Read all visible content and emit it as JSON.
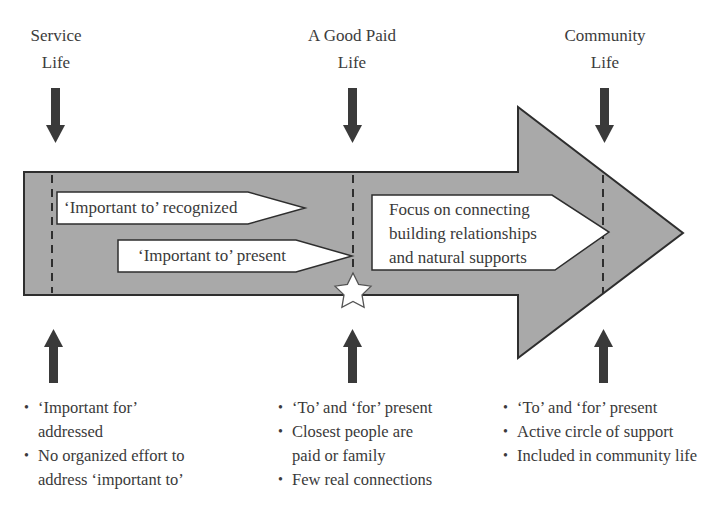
{
  "stages": [
    {
      "title_line1": "Service",
      "title_line2": "Life"
    },
    {
      "title_line1": "A Good Paid",
      "title_line2": "Life"
    },
    {
      "title_line1": "Community",
      "title_line2": "Life"
    }
  ],
  "inner_arrows": {
    "recognized": "‘Important to’ recognized",
    "present": "‘Important to’ present",
    "focus_line1": "Focus on connecting",
    "focus_line2": "building relationships",
    "focus_line3": "and natural supports"
  },
  "bullets": {
    "service": [
      "‘Important for’ addressed",
      "No organized effort to address ‘important to’"
    ],
    "paid": [
      "‘To’ and ‘for’ present",
      "Closest people are paid or family",
      "Few real connections"
    ],
    "community": [
      "‘To’ and ‘for’ present",
      "Active circle of support",
      "Included in community life"
    ]
  },
  "icons": {
    "milestone": "star-icon",
    "pointer_down": "arrow-down-icon",
    "pointer_up": "arrow-up-icon"
  },
  "colors": {
    "arrow_fill": "#a9a9a9",
    "arrow_stroke": "#2e2e2e",
    "pointer": "#3a3a3a",
    "box_fill": "#ffffff",
    "text": "#3a3a3a"
  }
}
